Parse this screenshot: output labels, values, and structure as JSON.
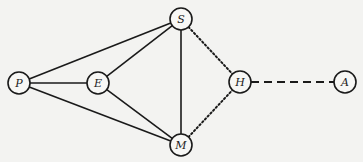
{
  "diagram": {
    "type": "network-graph",
    "background": "#f3f3f1",
    "nodes": [
      {
        "id": "P",
        "label": "P",
        "x": 19,
        "y": 83
      },
      {
        "id": "E",
        "label": "E",
        "x": 98,
        "y": 83
      },
      {
        "id": "S",
        "label": "S",
        "x": 181,
        "y": 19
      },
      {
        "id": "M",
        "label": "M",
        "x": 181,
        "y": 145
      },
      {
        "id": "H",
        "label": "H",
        "x": 240,
        "y": 82
      },
      {
        "id": "A",
        "label": "A",
        "x": 345,
        "y": 82
      }
    ],
    "edges": [
      {
        "from": "P",
        "to": "S",
        "style": "solid"
      },
      {
        "from": "P",
        "to": "E",
        "style": "solid"
      },
      {
        "from": "P",
        "to": "M",
        "style": "solid"
      },
      {
        "from": "E",
        "to": "S",
        "style": "solid"
      },
      {
        "from": "E",
        "to": "M",
        "style": "solid"
      },
      {
        "from": "S",
        "to": "M",
        "style": "solid"
      },
      {
        "from": "S",
        "to": "H",
        "style": "dotted"
      },
      {
        "from": "M",
        "to": "H",
        "style": "dotted"
      },
      {
        "from": "H",
        "to": "A",
        "style": "dashed"
      }
    ],
    "node_radius": 11
  }
}
